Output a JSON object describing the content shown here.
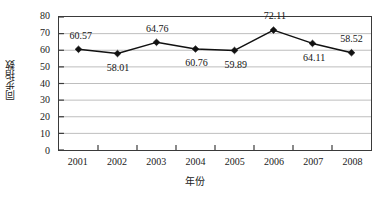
{
  "chart_data": {
    "type": "line",
    "title": "",
    "xlabel": "年份",
    "ylabel": "同步指数",
    "categories": [
      "2001",
      "2002",
      "2003",
      "2004",
      "2005",
      "2006",
      "2007",
      "2008"
    ],
    "values": [
      60.57,
      58.01,
      64.76,
      60.76,
      59.89,
      72.11,
      64.11,
      58.52
    ],
    "point_labels": [
      "60.57",
      "58.01",
      "64.76",
      "60.76",
      "59.89",
      "72.11",
      "64.11",
      "58.52"
    ],
    "label_positions": [
      "above",
      "below",
      "above",
      "below",
      "below",
      "above",
      "below",
      "above"
    ],
    "ylim": [
      0,
      80
    ],
    "ytick_step": 10,
    "ytick_labels": [
      "0",
      "10",
      "20",
      "30",
      "40",
      "50",
      "60",
      "70",
      "80"
    ],
    "grid": true,
    "grid_axis": "y",
    "legend": "none",
    "marker": "diamond",
    "series_color": "#111111",
    "grid_color": "#bdbdbd",
    "frame_color": "#3a3a3a",
    "background_color": "#ffffff"
  }
}
